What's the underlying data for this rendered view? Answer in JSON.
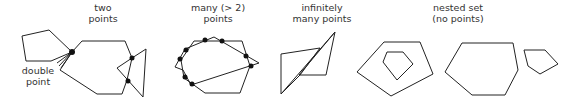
{
  "panels": [
    {
      "id": "two-points",
      "label_line1": "two",
      "label_line2": "points"
    },
    {
      "id": "many-points",
      "label_line1": "many (> 2)",
      "label_line2": "points"
    },
    {
      "id": "infinitely-many",
      "label_line1": "infinitely",
      "label_line2": "many points"
    },
    {
      "id": "nested-set",
      "label_line1": "nested set",
      "label_line2": "(no points)"
    }
  ],
  "annotations": {
    "double_point_line1": "double",
    "double_point_line2": "point"
  },
  "colors": {
    "stroke": "#222222",
    "point": "#111111",
    "text": "#333333"
  }
}
